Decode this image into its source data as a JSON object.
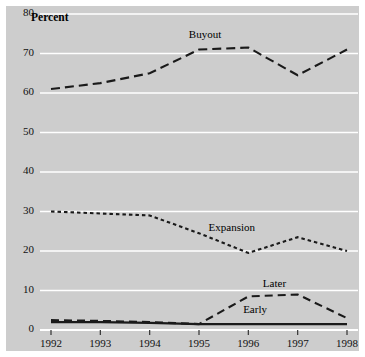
{
  "chart_data": {
    "type": "line",
    "title": "",
    "xlabel": "",
    "ylabel": "Percent",
    "categories": [
      "1992",
      "1993",
      "1994",
      "1995",
      "1996",
      "1997",
      "1998"
    ],
    "x": [
      1992,
      1993,
      1994,
      1995,
      1996,
      1997,
      1998
    ],
    "xlim": [
      1992,
      1998
    ],
    "ylim": [
      0,
      80
    ],
    "yticks": [
      0,
      10,
      20,
      30,
      40,
      50,
      60,
      70,
      80
    ],
    "grid": true,
    "legend_position": "inline-annotations",
    "series": [
      {
        "name": "Buyout",
        "values": [
          61,
          62.5,
          65,
          71,
          71.5,
          64.5,
          71
        ],
        "style": "dashed-long",
        "color": "#1a1a1a"
      },
      {
        "name": "Expansion",
        "values": [
          30,
          29.5,
          29,
          24.5,
          19.5,
          23.5,
          20
        ],
        "style": "dotted-short",
        "color": "#1a1a1a"
      },
      {
        "name": "Later",
        "values": [
          2.5,
          2.3,
          2,
          1.5,
          8.5,
          9,
          3
        ],
        "style": "dashed-medium",
        "color": "#1a1a1a"
      },
      {
        "name": "Early",
        "values": [
          2,
          2,
          1.8,
          1.5,
          1.5,
          1.5,
          1.5
        ],
        "style": "solid",
        "color": "#1a1a1a"
      }
    ],
    "annotations": [
      {
        "text": "Buyout",
        "x": 1995.2,
        "y": 74.5
      },
      {
        "text": "Expansion",
        "x": 1995.6,
        "y": 25.5
      },
      {
        "text": "Later",
        "x": 1996.7,
        "y": 11.5
      },
      {
        "text": "Early",
        "x": 1996.3,
        "y": 4.8
      }
    ]
  },
  "colors": {
    "plot_background": "#cdcdcd",
    "gridline": "#ffffff",
    "line": "#1a1a1a",
    "text": "#111111",
    "page_background": "#ffffff"
  }
}
